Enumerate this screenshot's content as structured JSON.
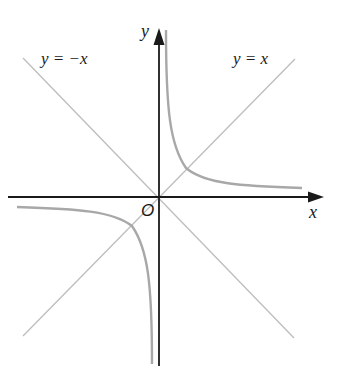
{
  "diagram": {
    "title": "",
    "colors": {
      "background": "#ffffff",
      "axis": "#1a1a1a",
      "guide_line": "#bdbdbd",
      "curve": "#a8a8a8",
      "text": "#1a1a1a"
    },
    "axes": {
      "x_label": "x",
      "y_label": "y",
      "origin_label": "O",
      "origin_px": [
        159,
        197
      ]
    },
    "lines": [
      {
        "label": "y = −x",
        "equation": "y = -x"
      },
      {
        "label": "y = x",
        "equation": "y = x"
      }
    ],
    "curve": {
      "type": "hyperbola",
      "equation": "y = k/x (k > 0)",
      "branches": [
        "first quadrant",
        "third quadrant"
      ],
      "asymptotes": [
        "x-axis",
        "y-axis"
      ]
    }
  }
}
